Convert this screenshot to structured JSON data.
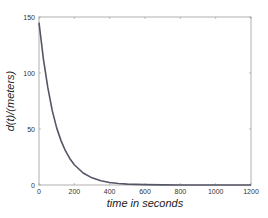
{
  "chart_data": {
    "type": "line",
    "title": "",
    "xlabel": "time in seconds",
    "ylabel": "d(t)/(meters)",
    "xlim": [
      0,
      1200
    ],
    "ylim": [
      0,
      150
    ],
    "xticks": [
      0,
      200,
      400,
      600,
      800,
      1000,
      1200
    ],
    "yticks": [
      0,
      50,
      100,
      150
    ],
    "xtick_labels": [
      "0",
      "200",
      "400",
      "600",
      "800",
      "1000",
      "1200"
    ],
    "ytick_labels": [
      "0",
      "50",
      "100",
      "150"
    ],
    "grid": false,
    "legend": null,
    "series": [
      {
        "name": "d(t)",
        "color": "#555566",
        "x": [
          0,
          25,
          50,
          75,
          100,
          125,
          150,
          175,
          200,
          250,
          300,
          350,
          400,
          450,
          500,
          600,
          700,
          800,
          900,
          1000,
          1100,
          1200
        ],
        "y": [
          145,
          112.3,
          86.9,
          66.4,
          51.0,
          39.4,
          30.4,
          23.5,
          18.1,
          10.7,
          6.4,
          3.8,
          2.2,
          1.3,
          0.8,
          0.3,
          0.1,
          0.03,
          0.01,
          0.0,
          0.0,
          0.0
        ]
      }
    ]
  }
}
